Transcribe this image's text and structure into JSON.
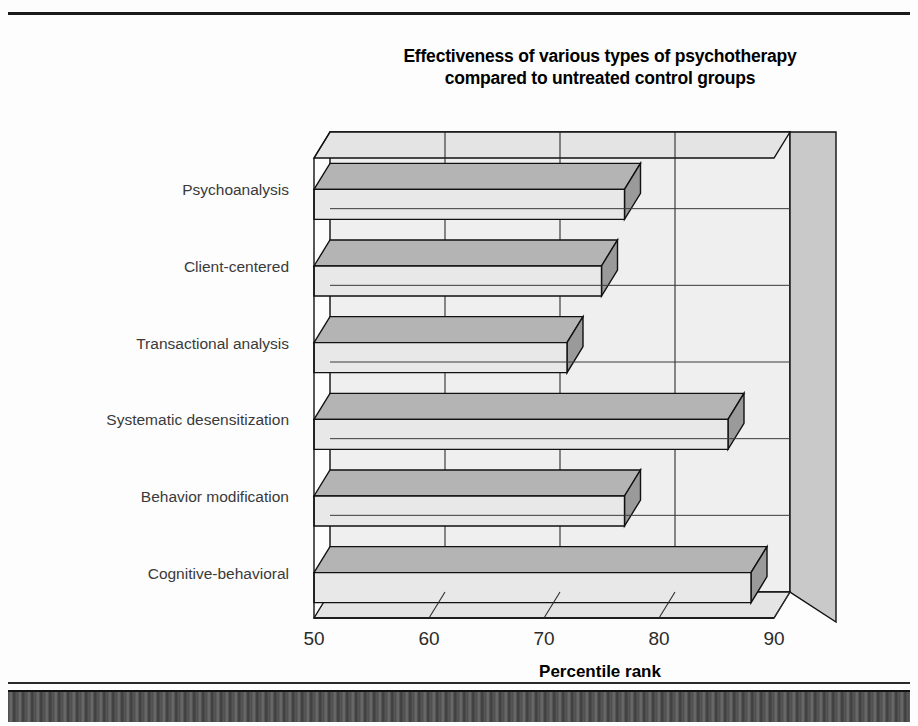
{
  "figure": {
    "title_line1": "Effectiveness of various types of psychotherapy",
    "title_line2": "compared to untreated control groups"
  },
  "axis": {
    "x_title": "Percentile rank",
    "x_ticks": [
      "50",
      "60",
      "70",
      "80",
      "90"
    ]
  },
  "colors": {
    "bar_front": "#e8e8e8",
    "bar_top": "#b4b4b4",
    "bar_side": "#9a9a9a",
    "wall_back": "#efefef",
    "wall_floor": "#e4e4e4",
    "wall_side": "#c9c9c9",
    "outline": "#111111",
    "label_text": "#3a3a3a",
    "title_text": "#000000"
  },
  "chart_data": {
    "type": "bar",
    "orientation": "horizontal",
    "title": "Effectiveness of various types of psychotherapy compared to untreated control groups",
    "xlabel": "Percentile rank",
    "ylabel": "",
    "xlim": [
      50,
      90
    ],
    "xticks": [
      50,
      60,
      70,
      80,
      90
    ],
    "grid": true,
    "legend": "none",
    "categories": [
      "Psychoanalysis",
      "Client-centered",
      "Transactional analysis",
      "Systematic desensitization",
      "Behavior modification",
      "Cognitive-behavioral"
    ],
    "values": [
      77,
      75,
      72,
      86,
      77,
      88
    ]
  }
}
